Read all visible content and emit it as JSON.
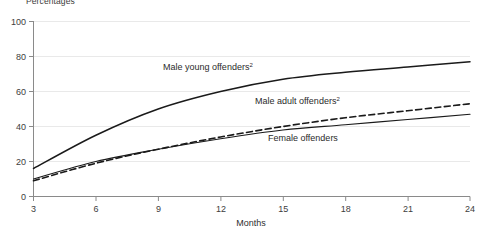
{
  "chart_data": {
    "type": "line",
    "title": "Percentages",
    "xlabel": "Months",
    "ylabel": "",
    "xlim": [
      3,
      24
    ],
    "ylim": [
      0,
      100
    ],
    "grid": true,
    "legend_position": "inline-annotations",
    "x": [
      3,
      6,
      9,
      12,
      15,
      18,
      21,
      24
    ],
    "xticks": [
      "3",
      "6",
      "9",
      "12",
      "15",
      "18",
      "21",
      "24"
    ],
    "yticks": [
      "0",
      "20",
      "40",
      "60",
      "80",
      "100"
    ],
    "series": [
      {
        "name": "Male young offenders",
        "footnote": "2",
        "label": "Male young offenders",
        "style": "solid",
        "color": "#1a1a1a",
        "values": [
          16,
          35,
          50,
          60,
          67,
          71,
          74,
          77
        ]
      },
      {
        "name": "Male adult offenders",
        "footnote": "2",
        "label": "Male adult offenders",
        "style": "dashed",
        "color": "#1a1a1a",
        "values": [
          9,
          19,
          27,
          34,
          40,
          45,
          49,
          53
        ]
      },
      {
        "name": "Female offenders",
        "footnote": "",
        "label": "Female offenders",
        "style": "solid",
        "color": "#1a1a1a",
        "values": [
          10,
          20,
          27,
          33,
          38,
          41,
          44,
          47
        ]
      }
    ],
    "annotations": [
      {
        "text": "Male young offenders",
        "sup": "2",
        "x": 163,
        "y": 70
      },
      {
        "text": "Male adult offenders",
        "sup": "2",
        "x": 255,
        "y": 104
      },
      {
        "text": "Female offenders",
        "sup": "",
        "x": 268,
        "y": 141
      }
    ]
  }
}
